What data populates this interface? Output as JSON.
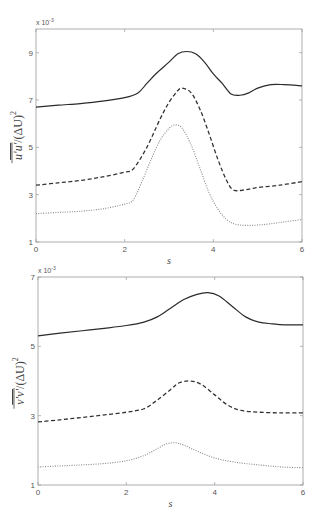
{
  "chart_data": [
    {
      "type": "line",
      "title": "",
      "xlabel": "s",
      "ylabel": "u'u' / (ΔU)^2",
      "ylabel_overline": "u'u'",
      "ylabel_rest": "/(ΔU)",
      "ylabel_exp": "2",
      "y_scale_label": "x 10",
      "y_scale_exp": "-3",
      "xlim": [
        0,
        6
      ],
      "ylim": [
        1,
        10
      ],
      "xticks": [
        0,
        2,
        4,
        6
      ],
      "yticks": [
        1,
        3,
        5,
        7,
        9
      ],
      "grid": false,
      "legend": null,
      "series": [
        {
          "name": "solid",
          "style": "solid",
          "x": [
            0,
            0.5,
            1,
            1.5,
            2,
            2.3,
            2.5,
            2.7,
            3.0,
            3.2,
            3.4,
            3.6,
            3.8,
            4.0,
            4.2,
            4.4,
            4.6,
            4.8,
            5.0,
            5.3,
            5.6,
            6.0
          ],
          "y": [
            6.7,
            6.78,
            6.85,
            6.95,
            7.1,
            7.3,
            7.7,
            8.1,
            8.6,
            8.95,
            9.05,
            8.95,
            8.6,
            8.1,
            7.7,
            7.25,
            7.2,
            7.3,
            7.5,
            7.65,
            7.65,
            7.6
          ]
        },
        {
          "name": "dashed",
          "style": "dashed",
          "x": [
            0,
            0.5,
            1,
            1.5,
            2,
            2.2,
            2.5,
            2.8,
            3.0,
            3.2,
            3.3,
            3.5,
            3.7,
            3.9,
            4.1,
            4.3,
            4.45,
            4.7,
            5.0,
            5.5,
            6.0
          ],
          "y": [
            3.4,
            3.5,
            3.6,
            3.75,
            3.95,
            4.1,
            5.0,
            6.2,
            6.9,
            7.4,
            7.5,
            7.3,
            6.6,
            5.6,
            4.5,
            3.6,
            3.2,
            3.2,
            3.3,
            3.4,
            3.55
          ]
        },
        {
          "name": "dotted",
          "style": "dotted",
          "x": [
            0,
            0.5,
            1,
            1.5,
            2,
            2.2,
            2.4,
            2.6,
            2.8,
            3.0,
            3.15,
            3.3,
            3.5,
            3.7,
            3.9,
            4.1,
            4.3,
            4.5,
            4.8,
            5.2,
            5.6,
            6.0
          ],
          "y": [
            2.2,
            2.25,
            2.3,
            2.4,
            2.6,
            2.8,
            3.6,
            4.5,
            5.3,
            5.8,
            5.95,
            5.8,
            5.1,
            4.1,
            3.1,
            2.4,
            1.95,
            1.75,
            1.7,
            1.75,
            1.85,
            1.95
          ]
        }
      ]
    },
    {
      "type": "line",
      "title": "",
      "xlabel": "s",
      "ylabel": "v'v' / (ΔU)^2",
      "ylabel_overline": "v'v'",
      "ylabel_rest": "/(ΔU)",
      "ylabel_exp": "2",
      "y_scale_label": "x 10",
      "y_scale_exp": "-3",
      "xlim": [
        0,
        6
      ],
      "ylim": [
        1,
        7
      ],
      "xticks": [
        0,
        2,
        4,
        6
      ],
      "yticks": [
        1,
        3,
        5,
        7
      ],
      "grid": false,
      "legend": null,
      "series": [
        {
          "name": "solid",
          "style": "solid",
          "x": [
            0,
            0.5,
            1,
            1.5,
            2,
            2.4,
            2.7,
            3.0,
            3.3,
            3.6,
            3.85,
            4.1,
            4.4,
            4.7,
            5.0,
            5.3,
            5.6,
            6.0
          ],
          "y": [
            5.3,
            5.38,
            5.45,
            5.52,
            5.6,
            5.7,
            5.85,
            6.1,
            6.35,
            6.5,
            6.55,
            6.45,
            6.15,
            5.85,
            5.7,
            5.65,
            5.62,
            5.62
          ]
        },
        {
          "name": "dashed",
          "style": "dashed",
          "x": [
            0,
            0.5,
            1,
            1.5,
            2,
            2.4,
            2.7,
            3.0,
            3.2,
            3.45,
            3.7,
            4.0,
            4.3,
            4.6,
            5.0,
            5.5,
            6.0
          ],
          "y": [
            2.82,
            2.88,
            2.95,
            3.02,
            3.1,
            3.2,
            3.45,
            3.75,
            3.95,
            4.0,
            3.9,
            3.6,
            3.3,
            3.15,
            3.1,
            3.08,
            3.08
          ]
        },
        {
          "name": "dotted",
          "style": "dotted",
          "x": [
            0,
            0.5,
            1,
            1.5,
            2,
            2.4,
            2.7,
            2.9,
            3.1,
            3.3,
            3.6,
            4.0,
            4.5,
            5.0,
            5.5,
            6.0
          ],
          "y": [
            1.52,
            1.55,
            1.58,
            1.62,
            1.7,
            1.85,
            2.05,
            2.18,
            2.22,
            2.15,
            1.98,
            1.78,
            1.65,
            1.58,
            1.52,
            1.5
          ]
        }
      ]
    }
  ],
  "layout": {
    "panels": [
      {
        "left": 36,
        "top": 29,
        "right": 302,
        "bottom": 242
      },
      {
        "left": 38,
        "top": 277,
        "right": 303,
        "bottom": 485
      }
    ]
  }
}
